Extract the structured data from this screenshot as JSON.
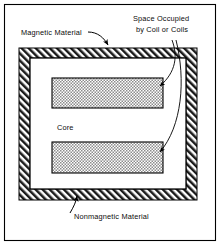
{
  "figure": {
    "background_color": "#ffffff",
    "ink_color": "#000000"
  },
  "frame": {
    "name": "outer-border",
    "x": 4,
    "y": 4,
    "width": 211,
    "height": 236,
    "stroke_color": "#000000"
  },
  "labels": {
    "magnetic_material": "Magnetic Material",
    "space_occupied_line1": "Space Occupied",
    "space_occupied_line2": "by Coil or Coils",
    "core": "Core",
    "nonmagnetic_material": "Nonmagnetic Material"
  },
  "shapes": {
    "magnetic_band": {
      "label": "Magnetic Material",
      "outer": {
        "x": 19,
        "y": 48,
        "width": 178,
        "height": 152
      },
      "inner": {
        "x": 30,
        "y": 58,
        "width": 156,
        "height": 131
      },
      "fill": "diagonal-hatch",
      "hatch_angle_deg": 45,
      "stroke_color": "#000000"
    },
    "core_region": {
      "label": "Core",
      "x": 30,
      "y": 58,
      "width": 156,
      "height": 131,
      "fill": "#ffffff"
    },
    "coil_upper": {
      "label": "Space Occupied by Coil or Coils",
      "x": 52,
      "y": 78,
      "width": 111,
      "height": 30,
      "fill": "cross-hatch-gray",
      "fill_color": "#b8b8b8",
      "stroke_color": "#000000"
    },
    "coil_lower": {
      "label": "Space Occupied by Coil or Coils",
      "x": 52,
      "y": 142,
      "width": 111,
      "height": 31,
      "fill": "cross-hatch-gray",
      "fill_color": "#b8b8b8",
      "stroke_color": "#000000"
    }
  },
  "leaders": [
    {
      "name": "leader-magnetic-material",
      "from": "Magnetic Material",
      "to": "magnetic band top edge"
    },
    {
      "name": "leader-coil-upper",
      "from": "Space Occupied by Coil or Coils",
      "to": "coil_upper right end"
    },
    {
      "name": "leader-coil-lower",
      "from": "Space Occupied by Coil or Coils",
      "to": "coil_lower right end"
    },
    {
      "name": "leader-nonmagnetic-material",
      "from": "Nonmagnetic Material",
      "to": "magnetic band bottom edge"
    }
  ]
}
